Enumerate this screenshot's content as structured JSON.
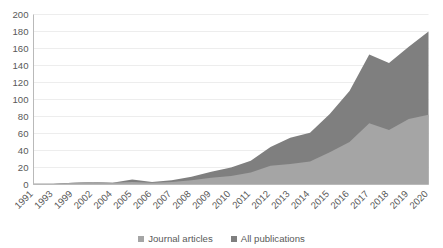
{
  "chart_data": {
    "type": "area",
    "title": "",
    "subtitle": "",
    "xlabel": "",
    "ylabel": "",
    "ylim": [
      0,
      200
    ],
    "ytick_step": 20,
    "yticks": [
      "0",
      "20",
      "40",
      "60",
      "80",
      "100",
      "120",
      "140",
      "160",
      "180",
      "200"
    ],
    "grid": true,
    "grid_axis": "y",
    "legend_position": "bottom",
    "categories": [
      "1991",
      "1993",
      "1999",
      "2002",
      "2004",
      "2005",
      "2006",
      "2007",
      "2008",
      "2009",
      "2010",
      "2011",
      "2012",
      "2013",
      "2014",
      "2015",
      "2016",
      "2017",
      "2018",
      "2019",
      "2020"
    ],
    "series": [
      {
        "name": "All publications",
        "color": "#7f7f7f",
        "values": [
          1,
          1,
          2,
          3,
          2,
          6,
          3,
          5,
          9,
          15,
          20,
          28,
          44,
          55,
          61,
          83,
          110,
          153,
          143,
          162,
          180
        ]
      },
      {
        "name": "Journal articles",
        "color": "#a5a5a5",
        "values": [
          1,
          1,
          2,
          3,
          2,
          3,
          2,
          3,
          5,
          8,
          10,
          14,
          22,
          24,
          27,
          38,
          50,
          72,
          64,
          77,
          82
        ]
      }
    ]
  },
  "legend": {
    "items": [
      {
        "label": "Journal articles",
        "color": "#a5a5a5"
      },
      {
        "label": "All publications",
        "color": "#7f7f7f"
      }
    ]
  },
  "axes": {
    "y": {
      "min": 0,
      "max": 200,
      "step": 20
    }
  }
}
